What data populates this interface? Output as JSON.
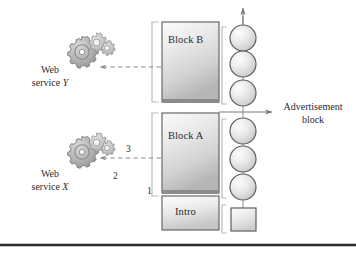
{
  "figure": {
    "background": "#ffffff",
    "rule_color": "#2a2a2a"
  },
  "blocks": [
    {
      "id": "block-b",
      "label": "Block B",
      "x": 162,
      "y": 22,
      "w": 57,
      "h": 80,
      "fill_top": "#f2f2f2",
      "fill_bottom": "#bdbdbd",
      "stroke": "#555555"
    },
    {
      "id": "block-a",
      "label": "Block A",
      "x": 162,
      "y": 113,
      "w": 57,
      "h": 80,
      "fill_top": "#f2f2f2",
      "fill_bottom": "#bdbdbd",
      "stroke": "#555555"
    },
    {
      "id": "intro",
      "label": "Intro",
      "x": 162,
      "y": 196,
      "w": 57,
      "h": 34,
      "fill_top": "#f5f5f5",
      "fill_bottom": "#cfcfcf",
      "stroke": "#555555"
    }
  ],
  "services": [
    {
      "id": "web-service-y",
      "line1": "Web",
      "line2_prefix": "service ",
      "line2_italic": "Y",
      "icon": "gears-icon",
      "cx": 96,
      "cy": 55,
      "label_x": 50,
      "label_y": 64
    },
    {
      "id": "web-service-x",
      "line1": "Web",
      "line2_prefix": "service ",
      "line2_italic": "X",
      "icon": "gears-icon",
      "cx": 96,
      "cy": 155,
      "label_x": 50,
      "label_y": 168
    }
  ],
  "annotations": [
    {
      "id": "annotation-3",
      "text": "3",
      "x": 128,
      "y": 148
    },
    {
      "id": "annotation-2",
      "text": "2",
      "x": 112,
      "y": 170
    },
    {
      "id": "annotation-1",
      "text": "1",
      "x": 148,
      "y": 188
    }
  ],
  "advertisement": {
    "id": "advertisement-block-label",
    "line1": "Advertisement",
    "line2": "block",
    "x": 276,
    "y": 100
  },
  "nodes": {
    "circle_fill_light": "#f6f6f6",
    "circle_fill_dark": "#c9c9c9",
    "circle_stroke": "#5a5a5a",
    "circles": [
      {
        "id": "ad-node-1",
        "cx": 243,
        "cy": 38,
        "r": 13
      },
      {
        "id": "ad-node-2",
        "cx": 243,
        "cy": 64,
        "r": 13
      },
      {
        "id": "ad-node-3",
        "cx": 243,
        "cy": 93,
        "r": 13
      },
      {
        "id": "ad-node-4",
        "cx": 243,
        "cy": 131,
        "r": 13
      },
      {
        "id": "ad-node-5",
        "cx": 243,
        "cy": 159,
        "r": 13
      },
      {
        "id": "ad-node-6",
        "cx": 243,
        "cy": 187,
        "r": 13
      }
    ],
    "square": {
      "id": "ad-node-square",
      "x": 231,
      "y": 208,
      "w": 25,
      "h": 23
    }
  },
  "connectors": {
    "dashed_color": "#8c8c8c",
    "solid_color": "#7a7a7a",
    "bracket_color": "#b4b4b4",
    "arrows": [
      {
        "id": "arrow-block-b-to-service-y",
        "style": "dashed",
        "from_x": 162,
        "to_x": 100,
        "y": 67
      },
      {
        "id": "arrow-block-a-to-service-x",
        "style": "dashed",
        "from_x": 162,
        "to_x": 100,
        "y": 158
      },
      {
        "id": "arrow-advertisement-out",
        "style": "solid",
        "from_x": 243,
        "to_x": 272,
        "y": 112
      },
      {
        "id": "arrow-chain-top",
        "style": "solid",
        "vertical": true,
        "x": 243,
        "from_y": 25,
        "to_y": 8
      }
    ]
  }
}
